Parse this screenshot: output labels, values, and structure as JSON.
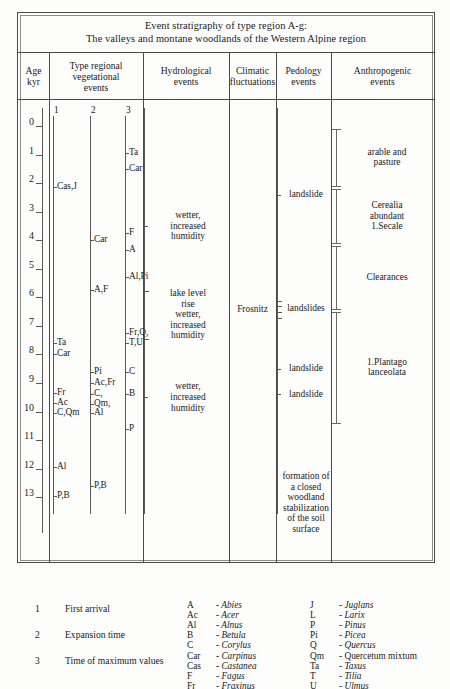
{
  "title": {
    "line1": "Event stratigraphy of type region A-g:",
    "line2": "The valleys and montane woodlands of the Western Alpine region"
  },
  "headers": [
    {
      "name": "age",
      "lines": [
        "Age",
        "kyr"
      ]
    },
    {
      "name": "vegetation",
      "lines": [
        "Type regional",
        "vegetational",
        "events"
      ]
    },
    {
      "name": "hydrological",
      "lines": [
        "Hydrological",
        "events"
      ]
    },
    {
      "name": "climatic",
      "lines": [
        "Climatic",
        "fluctuations"
      ]
    },
    {
      "name": "pedology",
      "lines": [
        "Pedology",
        "events"
      ]
    },
    {
      "name": "anthropogenic",
      "lines": [
        "Anthropogenic",
        "events"
      ]
    }
  ],
  "age_axis": {
    "unit": "kyr",
    "ticks": [
      "0",
      "1",
      "2",
      "3",
      "4",
      "5",
      "6",
      "7",
      "8",
      "9",
      "10",
      "11",
      "12",
      "13"
    ],
    "min": 0,
    "max": 13
  },
  "vegetation": {
    "subcolumn_labels": [
      "1",
      "2",
      "3"
    ],
    "col1": [
      {
        "label": "Cas,J",
        "age": 2.15
      },
      {
        "label": "Ta",
        "age": 7.6
      },
      {
        "label": "Car",
        "age": 8.0
      },
      {
        "label": "Fr",
        "age": 9.35
      },
      {
        "label": "Ac",
        "age": 9.7
      },
      {
        "label": "C,Qm",
        "age": 10.05
      },
      {
        "label": "Al",
        "age": 11.95
      },
      {
        "label": "P,B",
        "age": 12.95
      }
    ],
    "col2": [
      {
        "label": "Car",
        "age": 4.0
      },
      {
        "label": "A,F",
        "age": 5.75
      },
      {
        "label": "Pi",
        "age": 8.6
      },
      {
        "label": "Ac,Fr",
        "age": 9.0
      },
      {
        "label": "C,",
        "age": 9.4
      },
      {
        "label": "Qm,",
        "age": 9.75
      },
      {
        "label": "Al",
        "age": 10.05
      },
      {
        "label": "P,B",
        "age": 12.6
      }
    ],
    "col3": [
      {
        "label": "Ta",
        "age": 0.95
      },
      {
        "label": "Car",
        "age": 1.5
      },
      {
        "label": "F",
        "age": 3.75
      },
      {
        "label": "A",
        "age": 4.35
      },
      {
        "label": "Al,Pi",
        "age": 5.3
      },
      {
        "label": "Fr,Q,",
        "age": 7.25
      },
      {
        "label": "T,U",
        "age": 7.6
      },
      {
        "label": "C",
        "age": 8.6
      },
      {
        "label": "B",
        "age": 9.4
      },
      {
        "label": "P",
        "age": 10.6
      }
    ]
  },
  "hydrological": {
    "events": [
      {
        "text": "wetter,\nincreased\nhumidity",
        "marker": "tick",
        "age": 3.5
      },
      {
        "text": "lake level\nrise\nwetter,\nincreased\nhumidity",
        "marker": "bracket",
        "age": 6.6
      },
      {
        "text": "wetter,\nincreased\nhumidity",
        "marker": "tick",
        "age": 9.5
      }
    ]
  },
  "climatic": {
    "events": [
      {
        "text": "Frosnitz",
        "marker": "bracket",
        "age": 6.4
      }
    ]
  },
  "pedology": {
    "events": [
      {
        "text": "landslide",
        "marker": "tick",
        "age": 2.4
      },
      {
        "text": "landslides",
        "marker": "bracket",
        "age": 6.4
      },
      {
        "text": "landslide",
        "marker": "tick",
        "age": 8.5
      },
      {
        "text": "landslide",
        "marker": "tick",
        "age": 9.4
      },
      {
        "text": "formation of\na closed\nwoodland\nstabilization\nof the soil\nsurface",
        "marker": "none",
        "age": 13.2
      }
    ]
  },
  "anthropogenic": {
    "events": [
      {
        "text": "arable and\npasture",
        "marker": "span",
        "age_top": 0.1,
        "age_bottom": 2.1
      },
      {
        "text": "Cerealia\nabundant\n1.Secale",
        "marker": "span",
        "age_top": 2.2,
        "age_bottom": 4.1
      },
      {
        "text": "Clearances",
        "marker": "span",
        "age_top": 4.2,
        "age_bottom": 6.4
      },
      {
        "text": "1.Plantago\nlanceolata",
        "marker": "span",
        "age_top": 6.5,
        "age_bottom": 10.4
      }
    ]
  },
  "legend": {
    "ranks": [
      {
        "num": "1",
        "text": "First arrival"
      },
      {
        "num": "2",
        "text": "Expansion time"
      },
      {
        "num": "3",
        "text": "Time of maximum values"
      }
    ],
    "abbrev_left": [
      {
        "code": "A",
        "name": "- Abies",
        "italic": true
      },
      {
        "code": "Ac",
        "name": "- Acer",
        "italic": true
      },
      {
        "code": "Al",
        "name": "- Alnus",
        "italic": true
      },
      {
        "code": "B",
        "name": "- Betula",
        "italic": true
      },
      {
        "code": "C",
        "name": "- Corylus",
        "italic": true
      },
      {
        "code": "Car",
        "name": "- Carpinus",
        "italic": true
      },
      {
        "code": "Cas",
        "name": "- Castanea",
        "italic": true
      },
      {
        "code": "F",
        "name": "- Fagus",
        "italic": true
      },
      {
        "code": "Fr",
        "name": "- Fraxinus",
        "italic": true
      }
    ],
    "abbrev_right": [
      {
        "code": "J",
        "name": "- Juglans",
        "italic": true
      },
      {
        "code": "L",
        "name": "- Larix",
        "italic": true
      },
      {
        "code": "P",
        "name": "- Pinus",
        "italic": true
      },
      {
        "code": "Pi",
        "name": "- Picea",
        "italic": true
      },
      {
        "code": "Q",
        "name": "- Quercus",
        "italic": true
      },
      {
        "code": "Qm",
        "name": "- Quercetum mixtum",
        "italic": false
      },
      {
        "code": "Ta",
        "name": "- Taxus",
        "italic": true
      },
      {
        "code": "T",
        "name": "- Tilia",
        "italic": true
      },
      {
        "code": "U",
        "name": "- Ulmus",
        "italic": true
      }
    ]
  },
  "colors": {
    "ink": "#1b1b1b",
    "rule": "#4a4a46",
    "axis": "#58585a",
    "paper": "#fdfdfb"
  }
}
